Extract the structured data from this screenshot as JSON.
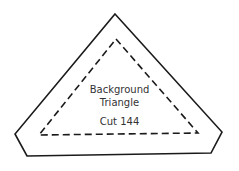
{
  "template": {
    "title_line1": "Background",
    "title_line2": "Triangle",
    "cut_label": "Cut 144",
    "stroke_color": "#1a1a1a",
    "outer_line": "solid",
    "seam_line": "dashed"
  }
}
